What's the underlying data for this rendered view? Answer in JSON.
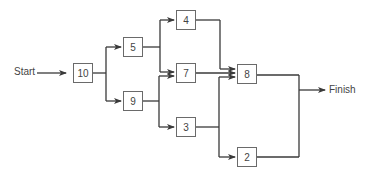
{
  "diagram": {
    "type": "activity-network",
    "start_label": "Start",
    "finish_label": "Finish",
    "nodes": {
      "n10": "10",
      "n5": "5",
      "n9": "9",
      "n4": "4",
      "n7": "7",
      "n3": "3",
      "n8": "8",
      "n2": "2"
    },
    "edges": [
      [
        "Start",
        "10"
      ],
      [
        "10",
        "5"
      ],
      [
        "10",
        "9"
      ],
      [
        "5",
        "4"
      ],
      [
        "5",
        "7"
      ],
      [
        "9",
        "7"
      ],
      [
        "9",
        "3"
      ],
      [
        "4",
        "8"
      ],
      [
        "7",
        "8"
      ],
      [
        "3",
        "8"
      ],
      [
        "3",
        "2"
      ],
      [
        "8",
        "Finish"
      ],
      [
        "2",
        "Finish"
      ]
    ],
    "colors": {
      "line": "#3a3a3a",
      "box_border": "#6a6a6a",
      "text": "#444444"
    }
  }
}
